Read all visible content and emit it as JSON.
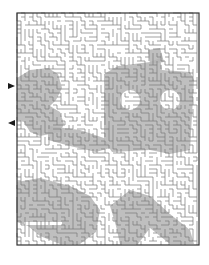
{
  "puzzle": {
    "type": "maze",
    "title": "",
    "colors": {
      "background": "#ffffff",
      "wall": "#7a7a7a",
      "border": "#333333",
      "shaded_region": "#b4b4b4",
      "arrow": "#1a1a1a"
    },
    "frame": {
      "x": 17,
      "y": 13,
      "width": 182,
      "height": 232
    },
    "arrows": [
      {
        "name": "entry-arrow",
        "x": 10,
        "y": 86,
        "direction": "right"
      },
      {
        "name": "exit-arrow",
        "x": 10,
        "y": 123,
        "direction": "left"
      }
    ],
    "hidden_picture": "shaded figure of a person seated at a table with wheels/gears shape on the right"
  }
}
